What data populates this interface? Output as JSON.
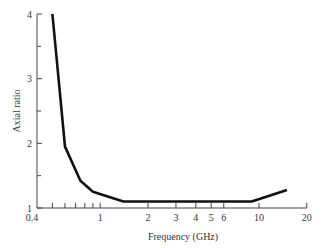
{
  "chart_data": {
    "type": "line",
    "title": "",
    "xlabel": "Frequency (GHz)",
    "ylabel": "Axial ratio",
    "xscale": "log",
    "xlim": [
      0.4,
      20
    ],
    "ylim": [
      1,
      4
    ],
    "x_ticks_labeled": [
      0.4,
      1,
      2,
      3,
      4,
      5,
      6,
      10,
      20
    ],
    "x_tick_labels": [
      "0.4",
      "1",
      "2",
      "3",
      "4",
      "5",
      "6",
      "10",
      "20"
    ],
    "x_minor_ticks": [
      0.5,
      0.6,
      0.7,
      0.8,
      0.9
    ],
    "y_ticks": [
      1,
      2,
      3,
      4
    ],
    "y_tick_labels": [
      "1",
      "2",
      "3",
      "4"
    ],
    "y_minor_ticks": [
      1.5,
      2.5,
      3.5
    ],
    "grid": false,
    "legend": null,
    "series": [
      {
        "name": "Axial ratio",
        "x": [
          0.5,
          0.6,
          0.75,
          0.9,
          1.4,
          9,
          15
        ],
        "y": [
          4.0,
          1.95,
          1.42,
          1.25,
          1.1,
          1.1,
          1.28
        ]
      }
    ]
  }
}
